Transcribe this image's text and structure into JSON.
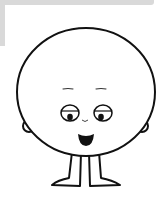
{
  "illustration": {
    "subject": "cartoon round character",
    "parts": [
      "head",
      "left-ear",
      "right-ear",
      "left-eyebrow",
      "right-eyebrow",
      "left-eye",
      "right-eye",
      "nose",
      "mouth",
      "left-leg",
      "right-leg"
    ],
    "colors": {
      "background": "#ffffff",
      "outline": "#111111",
      "fill": "#ffffff",
      "corner_tab": "#d9d9d9"
    }
  }
}
